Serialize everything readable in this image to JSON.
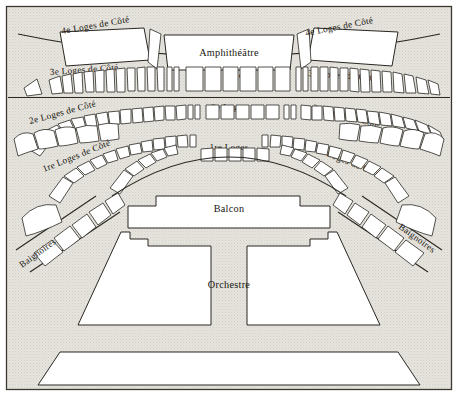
{
  "diagram": {
    "background_color": "#e4e2dc",
    "ink_color": "#2a2722",
    "seat_fill": "#ffffff",
    "width": 458,
    "height": 396
  },
  "levels": {
    "amphitheatre": "Amphithéâtre",
    "loges_4e_cote_left": "4e Loges de Côté",
    "loges_4e_cote_right": "4e Loges de Côté",
    "loges_3e_cote_left": "3e Loges de Côté",
    "loges_3e_center": "3e Loges",
    "loges_3e_cote_right": "3e Loges de Côté",
    "loges_2e_cote_left": "2e Loges de Côté",
    "loges_2e_center": "2e Loges",
    "loges_2e_cote_right": "2e Loges de Côté",
    "loges_1re_cote_left": "1re Loges de Côté",
    "loges_1re_center": "1re Loges",
    "loges_1re_cote_right": "1re Loges de Côté",
    "baignoires_left": "Baignoires",
    "baignoires_right": "Baignoires",
    "balcon": "Balcon",
    "orchestre": "Orchestre"
  },
  "seat_counts": {
    "loges_3e_cote_left": 13,
    "loges_3e_center": 13,
    "loges_3e_cote_right": 13,
    "loges_2e_cote_left": 15,
    "loges_2e_center": 13,
    "loges_2e_cote_right": 15,
    "loges_1re_cote_left": 16,
    "loges_1re_center": 12,
    "loges_1re_cote_right": 16,
    "baignoires_left": 5,
    "baignoires_right": 5
  }
}
